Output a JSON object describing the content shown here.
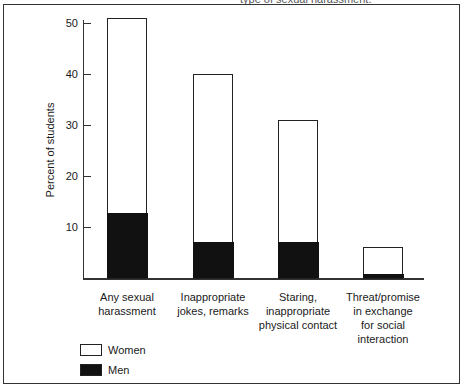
{
  "caption_fragment": "type of sexual harassment.",
  "chart_data": {
    "type": "bar",
    "stacked": true,
    "title": "",
    "xlabel": "",
    "ylabel": "Percent of students",
    "ylim": [
      0,
      52
    ],
    "yticks": [
      10,
      20,
      30,
      40,
      50
    ],
    "grid": false,
    "legend_position": "bottom-left",
    "categories": [
      "Any sexual harassment",
      "Inappropriate jokes, remarks",
      "Staring, inappropriate physical contact",
      "Threat/promise in exchange for social interaction"
    ],
    "series": [
      {
        "name": "Women",
        "color": "#ffffff",
        "values": [
          51,
          40,
          31,
          6
        ]
      },
      {
        "name": "Men",
        "color": "#111111",
        "values": [
          12.7,
          7,
          7,
          0.8
        ]
      }
    ],
    "note": "Bars overlay: white bar shows Women total; black segment shows Men."
  },
  "axis": {
    "tick_labels": [
      "10",
      "20",
      "30",
      "40",
      "50"
    ],
    "ylabel": "Percent of students"
  },
  "categories": [
    {
      "lines": [
        "Any sexual",
        "harassment"
      ]
    },
    {
      "lines": [
        "Inappropriate",
        "jokes, remarks"
      ]
    },
    {
      "lines": [
        "Staring,",
        "inappropriate",
        "physical contact"
      ]
    },
    {
      "lines": [
        "Threat/promise",
        "in exchange",
        "for social",
        "interaction"
      ]
    }
  ],
  "legend": {
    "women": "Women",
    "men": "Men"
  }
}
